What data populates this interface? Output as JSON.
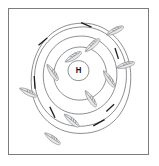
{
  "figure": {
    "type": "weather-map",
    "title": "",
    "background_color": "#ffffff",
    "frame_color": "#7a7d80"
  },
  "pressure_center": {
    "label": "H",
    "name": "high-pressure-center",
    "x": 80,
    "y": 67,
    "description": "High pressure center"
  },
  "chart_data": {
    "type": "diagram",
    "title": "",
    "subtitle": "",
    "xlabel": "",
    "ylabel": "",
    "grid": false,
    "legend": false,
    "isobars": [
      {
        "name": "isobar-1-innermost",
        "level": 1,
        "path": "M 80 57 C 87 57 92 62 92 68 C 92 74 87 79 80 79 C 73 79 68 74 68 68 C 68 62 73 57 80 57 Z"
      },
      {
        "name": "isobar-2",
        "level": 2,
        "path": "M 80 42 C 97 41 110 53 112 68 C 114 83 104 97 87 100 C 70 103 55 93 52 78 C 49 60 62 43 80 42 Z"
      },
      {
        "name": "isobar-3",
        "level": 3,
        "path": "M 80 30 C 104 28 122 46 124 68 C 126 90 113 110 90 115 C 65 120 44 105 40 81 C 36 53 55 31 80 30 Z"
      },
      {
        "name": "isobar-4",
        "level": 4,
        "path": "M 80 20 C 110 17 133 40 135 68 C 137 96 122 122 94 128 C 62 135 35 116 30 86 C 25 50 48 22 80 20 Z"
      },
      {
        "name": "isobar-5-outermost",
        "level": 5,
        "path": "M 78 16 C 112 12 138 38 140 70 C 142 102 126 130 96 136 C 60 143 30 122 26 88 C 22 50 44 19 78 16 Z"
      }
    ],
    "flow_ticks": [
      {
        "name": "flow-tick-n",
        "x1": 83,
        "y1": 15,
        "x2": 95,
        "y2": 20,
        "angle": -25
      },
      {
        "name": "flow-tick-nw",
        "x1": 34,
        "y1": 40,
        "x2": 44,
        "y2": 32,
        "angle": 40
      },
      {
        "name": "flow-tick-w",
        "x1": 29,
        "y1": 74,
        "x2": 30,
        "y2": 88,
        "angle": 85
      },
      {
        "name": "flow-tick-sw",
        "x1": 47,
        "y1": 108,
        "x2": 53,
        "y2": 120,
        "angle": 60
      },
      {
        "name": "flow-tick-s",
        "x1": 97,
        "y1": 129,
        "x2": 110,
        "y2": 122,
        "angle": -25
      },
      {
        "name": "flow-tick-ne",
        "x1": 126,
        "y1": 55,
        "x2": 122,
        "y2": 43,
        "angle": -70
      },
      {
        "name": "flow-tick-se",
        "x1": 112,
        "y1": 113,
        "x2": 121,
        "y2": 105,
        "angle": -45
      }
    ],
    "wind_barbs": [
      {
        "name": "wind-barb-1",
        "x": 122,
        "y": 24,
        "angle": -25,
        "position": "upper-right"
      },
      {
        "name": "wind-barb-2",
        "x": 96,
        "y": 40,
        "angle": -40,
        "position": "north-northeast"
      },
      {
        "name": "wind-barb-3",
        "x": 74,
        "y": 53,
        "angle": -30,
        "position": "near-center-north"
      },
      {
        "name": "wind-barb-4",
        "x": 134,
        "y": 62,
        "angle": -15,
        "position": "east"
      },
      {
        "name": "wind-barb-5",
        "x": 115,
        "y": 77,
        "angle": 55,
        "position": "east-southeast"
      },
      {
        "name": "wind-barb-6",
        "x": 50,
        "y": 70,
        "angle": 55,
        "position": "west-inner"
      },
      {
        "name": "wind-barb-7",
        "x": 22,
        "y": 92,
        "angle": 25,
        "position": "west-outer"
      },
      {
        "name": "wind-barb-8",
        "x": 94,
        "y": 99,
        "angle": 55,
        "position": "southeast-inner"
      },
      {
        "name": "wind-barb-9",
        "x": 72,
        "y": 123,
        "angle": 40,
        "position": "south"
      },
      {
        "name": "wind-barb-10",
        "x": 50,
        "y": 143,
        "angle": 35,
        "position": "south-southwest"
      }
    ],
    "annotations": [
      {
        "name": "center-label",
        "text": "H",
        "x": 80,
        "y": 68
      }
    ]
  }
}
